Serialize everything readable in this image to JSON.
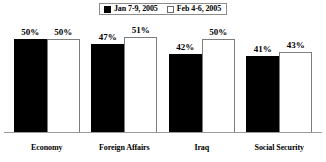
{
  "chart_data": {
    "type": "bar",
    "title": "",
    "subtitle": "",
    "xlabel": "",
    "ylabel": "",
    "ylim": [
      0,
      60
    ],
    "grid": false,
    "legend_position": "top-center",
    "categories": [
      "Economy",
      "Foreign Affairs",
      "Iraq",
      "Social Security"
    ],
    "series": [
      {
        "name": "Jan 7-9, 2005",
        "swatch": "filled",
        "color": "#000000",
        "values": [
          50,
          47,
          42,
          41
        ],
        "labels": [
          "50%",
          "47%",
          "42%",
          "41%"
        ]
      },
      {
        "name": "Feb 4-6, 2005",
        "swatch": "hollow",
        "color": "#ffffff",
        "values": [
          50,
          51,
          50,
          43
        ],
        "labels": [
          "50%",
          "51%",
          "50%",
          "43%"
        ]
      }
    ]
  },
  "legend": {
    "entries": [
      {
        "label": "Jan 7-9, 2005"
      },
      {
        "label": "Feb 4-6, 2005"
      }
    ]
  },
  "colors": {
    "series_filled": "#000000",
    "series_hollow": "#ffffff",
    "axis": "#9a9a9a",
    "text": "#000000",
    "background": "#ffffff"
  }
}
